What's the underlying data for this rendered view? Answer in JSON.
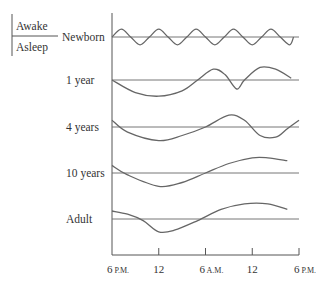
{
  "chart_data": {
    "type": "line",
    "title": "",
    "xlabel": "",
    "ylabel": "",
    "legend": {
      "upper": "Awake",
      "lower": "Asleep"
    },
    "x_ticks": [
      {
        "num": "6",
        "suffix": "P.M."
      },
      {
        "num": "12",
        "suffix": ""
      },
      {
        "num": "6",
        "suffix": "A.M."
      },
      {
        "num": "12",
        "suffix": ""
      },
      {
        "num": "6",
        "suffix": "P.M."
      }
    ],
    "x_range_hours": [
      0,
      24
    ],
    "series": [
      {
        "name": "Newborn",
        "description": "Frequent short alternating cycles of sleep and wakefulness (about 5 cycles per 24 hours)",
        "points": [
          [
            0,
            0
          ],
          [
            1.2,
            0.6
          ],
          [
            2.4,
            0
          ],
          [
            3.6,
            -0.6
          ],
          [
            4.8,
            0
          ],
          [
            6,
            0.6
          ],
          [
            7.2,
            0
          ],
          [
            8.4,
            -0.6
          ],
          [
            9.6,
            0
          ],
          [
            10.8,
            0.6
          ],
          [
            12,
            0
          ],
          [
            13.2,
            -0.6
          ],
          [
            14.4,
            0
          ],
          [
            15.6,
            0.6
          ],
          [
            16.8,
            0
          ],
          [
            18,
            -0.6
          ],
          [
            19.2,
            0
          ],
          [
            20.4,
            0.6
          ],
          [
            21.6,
            0
          ],
          [
            22.8,
            -0.6
          ],
          [
            23.3,
            0
          ]
        ]
      },
      {
        "name": "1 year",
        "description": "Long night sleep plus daytime nap dip",
        "points": [
          [
            0,
            0
          ],
          [
            3,
            -0.7
          ],
          [
            6,
            -0.9
          ],
          [
            9,
            -0.6
          ],
          [
            11,
            0
          ],
          [
            13,
            0.6
          ],
          [
            14.5,
            0.3
          ],
          [
            16,
            -0.5
          ],
          [
            17,
            0
          ],
          [
            19,
            0.7
          ],
          [
            21,
            0.6
          ],
          [
            23,
            0.1
          ]
        ]
      },
      {
        "name": "4 years",
        "description": "Night sleep with shorter afternoon dip",
        "points": [
          [
            0,
            0.4
          ],
          [
            2,
            -0.3
          ],
          [
            6,
            -0.8
          ],
          [
            9,
            -0.5
          ],
          [
            12,
            0
          ],
          [
            15,
            0.7
          ],
          [
            17,
            0.4
          ],
          [
            19,
            -0.5
          ],
          [
            21,
            -0.6
          ],
          [
            22.5,
            -0.1
          ],
          [
            24,
            0.4
          ]
        ]
      },
      {
        "name": "10 years",
        "description": "Single consolidated night sleep",
        "points": [
          [
            0,
            0.4
          ],
          [
            2,
            -0.1
          ],
          [
            6,
            -0.7
          ],
          [
            9,
            -0.5
          ],
          [
            12,
            0
          ],
          [
            15,
            0.5
          ],
          [
            18,
            0.8
          ],
          [
            20,
            0.8
          ],
          [
            22.5,
            0.65
          ]
        ]
      },
      {
        "name": "Adult",
        "description": "Single consolidated night sleep",
        "points": [
          [
            0,
            0.5
          ],
          [
            2,
            0.3
          ],
          [
            4,
            -0.1
          ],
          [
            6,
            -0.8
          ],
          [
            8,
            -0.7
          ],
          [
            11,
            -0.1
          ],
          [
            14,
            0.6
          ],
          [
            17,
            0.95
          ],
          [
            20,
            0.95
          ],
          [
            22.5,
            0.6
          ]
        ]
      }
    ]
  }
}
